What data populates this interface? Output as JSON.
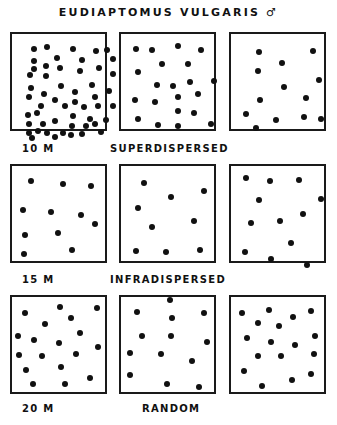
{
  "title": "EUDIAPTOMUS VULGARIS ♂",
  "rows": [
    {
      "depth": "10 M",
      "pattern": "SUPERDISPERSED",
      "boxes": [
        {
          "dots": [
            [
              22,
              15
            ],
            [
              35,
              13
            ],
            [
              61,
              15
            ],
            [
              84,
              17
            ],
            [
              95,
              16
            ],
            [
              22,
              27
            ],
            [
              45,
              24
            ],
            [
              70,
              26
            ],
            [
              101,
              25
            ],
            [
              22,
              35
            ],
            [
              34,
              32
            ],
            [
              48,
              34
            ],
            [
              68,
              37
            ],
            [
              87,
              34
            ],
            [
              18,
              41
            ],
            [
              34,
              42
            ],
            [
              101,
              40
            ],
            [
              19,
              54
            ],
            [
              49,
              52
            ],
            [
              63,
              58
            ],
            [
              80,
              51
            ],
            [
              97,
              57
            ],
            [
              17,
              63
            ],
            [
              32,
              60
            ],
            [
              43,
              66
            ],
            [
              63,
              68
            ],
            [
              83,
              63
            ],
            [
              29,
              72
            ],
            [
              53,
              72
            ],
            [
              72,
              73
            ],
            [
              86,
              72
            ],
            [
              101,
              72
            ],
            [
              16,
              81
            ],
            [
              25,
              79
            ],
            [
              43,
              87
            ],
            [
              61,
              82
            ],
            [
              78,
              85
            ],
            [
              94,
              86
            ],
            [
              17,
              90
            ],
            [
              31,
              90
            ],
            [
              60,
              92
            ],
            [
              74,
              92
            ],
            [
              83,
              90
            ],
            [
              17,
              99
            ],
            [
              26,
              97
            ],
            [
              35,
              99
            ],
            [
              51,
              99
            ],
            [
              59,
              101
            ],
            [
              70,
              100
            ],
            [
              89,
              98
            ],
            [
              20,
              104
            ],
            [
              43,
              103
            ]
          ]
        },
        {
          "dots": [
            [
              15,
              15
            ],
            [
              31,
              16
            ],
            [
              57,
              12
            ],
            [
              80,
              16
            ],
            [
              41,
              30
            ],
            [
              67,
              30
            ],
            [
              17,
              38
            ],
            [
              36,
              51
            ],
            [
              52,
              52
            ],
            [
              69,
              48
            ],
            [
              93,
              47
            ],
            [
              14,
              66
            ],
            [
              34,
              68
            ],
            [
              57,
              63
            ],
            [
              77,
              60
            ],
            [
              57,
              77
            ],
            [
              73,
              79
            ],
            [
              17,
              85
            ],
            [
              37,
              91
            ],
            [
              57,
              92
            ],
            [
              90,
              90
            ]
          ]
        },
        {
          "dots": [
            [
              28,
              18
            ],
            [
              82,
              17
            ],
            [
              51,
              29
            ],
            [
              27,
              37
            ],
            [
              88,
              46
            ],
            [
              53,
              53
            ],
            [
              75,
              64
            ],
            [
              29,
              66
            ],
            [
              15,
              80
            ],
            [
              45,
              86
            ],
            [
              73,
              83
            ],
            [
              90,
              85
            ],
            [
              25,
              94
            ]
          ]
        }
      ]
    },
    {
      "depth": "15 M",
      "pattern": "INFRADISPERSED",
      "boxes": [
        {
          "dots": [
            [
              19,
              15
            ],
            [
              51,
              18
            ],
            [
              79,
              20
            ],
            [
              11,
              44
            ],
            [
              39,
              46
            ],
            [
              69,
              49
            ],
            [
              83,
              58
            ],
            [
              13,
              69
            ],
            [
              46,
              67
            ],
            [
              60,
              84
            ],
            [
              12,
              88
            ]
          ]
        },
        {
          "dots": [
            [
              23,
              17
            ],
            [
              50,
              31
            ],
            [
              83,
              25
            ],
            [
              17,
              42
            ],
            [
              31,
              61
            ],
            [
              73,
              55
            ],
            [
              15,
              85
            ],
            [
              45,
              86
            ],
            [
              79,
              84
            ]
          ]
        },
        {
          "dots": [
            [
              15,
              12
            ],
            [
              39,
              15
            ],
            [
              68,
              14
            ],
            [
              28,
              34
            ],
            [
              90,
              33
            ],
            [
              20,
              57
            ],
            [
              49,
              55
            ],
            [
              72,
              48
            ],
            [
              14,
              86
            ],
            [
              40,
              93
            ],
            [
              60,
              77
            ],
            [
              76,
              99
            ]
          ]
        }
      ]
    },
    {
      "depth": "20 M",
      "pattern": "RANDOM",
      "boxes": [
        {
          "dots": [
            [
              13,
              16
            ],
            [
              48,
              10
            ],
            [
              85,
              11
            ],
            [
              33,
              27
            ],
            [
              59,
              21
            ],
            [
              68,
              36
            ],
            [
              6,
              39
            ],
            [
              22,
              43
            ],
            [
              47,
              46
            ],
            [
              86,
              50
            ],
            [
              7,
              58
            ],
            [
              30,
              59
            ],
            [
              64,
              57
            ],
            [
              14,
              73
            ],
            [
              49,
              70
            ],
            [
              78,
              81
            ],
            [
              21,
              87
            ],
            [
              53,
              87
            ]
          ]
        },
        {
          "dots": [
            [
              49,
              3
            ],
            [
              16,
              15
            ],
            [
              51,
              21
            ],
            [
              83,
              16
            ],
            [
              21,
              39
            ],
            [
              50,
              39
            ],
            [
              86,
              45
            ],
            [
              9,
              56
            ],
            [
              40,
              57
            ],
            [
              71,
              64
            ],
            [
              9,
              78
            ],
            [
              46,
              87
            ],
            [
              78,
              90
            ]
          ]
        },
        {
          "dots": [
            [
              11,
              16
            ],
            [
              38,
              13
            ],
            [
              62,
              20
            ],
            [
              80,
              14
            ],
            [
              27,
              26
            ],
            [
              48,
              29
            ],
            [
              16,
              41
            ],
            [
              40,
              45
            ],
            [
              64,
              48
            ],
            [
              84,
              39
            ],
            [
              27,
              59
            ],
            [
              50,
              59
            ],
            [
              83,
              57
            ],
            [
              13,
              74
            ],
            [
              61,
              83
            ],
            [
              31,
              89
            ],
            [
              80,
              77
            ]
          ]
        }
      ]
    }
  ],
  "colors": {
    "ink": "#111111",
    "background": "#ffffff"
  }
}
